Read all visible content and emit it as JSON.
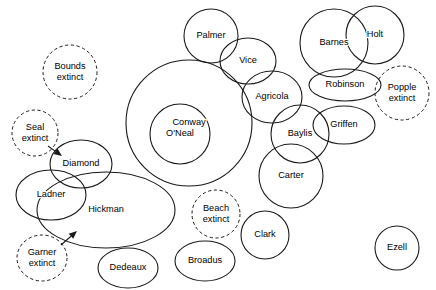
{
  "diagram": {
    "type": "euler-overlap-circle-diagram",
    "background_color": "#ffffff",
    "stroke_color": "#1a1a1a",
    "text_color": "#000000",
    "width": 436,
    "height": 290,
    "nodes": [
      {
        "id": "bounds",
        "label": "Bounds",
        "label2": "extinct",
        "style": "dashed",
        "shape": "circle",
        "cx": 70,
        "cy": 72,
        "rx": 27,
        "ry": 27
      },
      {
        "id": "seal",
        "label": "Seal",
        "label2": "extinct",
        "style": "dashed",
        "shape": "circle",
        "cx": 35,
        "cy": 133,
        "rx": 23,
        "ry": 23
      },
      {
        "id": "garner",
        "label": "Garner",
        "label2": "extinct",
        "style": "dashed",
        "shape": "ellipse",
        "cx": 42,
        "cy": 258,
        "rx": 25,
        "ry": 23
      },
      {
        "id": "popple",
        "label": "Popple",
        "label2": "extinct",
        "style": "dashed",
        "shape": "circle",
        "cx": 402,
        "cy": 93,
        "rx": 27,
        "ry": 27
      },
      {
        "id": "beach",
        "label": "Beach",
        "label2": "extinct",
        "style": "dashed",
        "shape": "circle",
        "cx": 216,
        "cy": 214,
        "rx": 24,
        "ry": 24
      },
      {
        "id": "palmer",
        "label": "Palmer",
        "label2": "",
        "style": "solid",
        "shape": "circle",
        "cx": 211,
        "cy": 36,
        "rx": 27,
        "ry": 27
      },
      {
        "id": "conway",
        "label": "Conway",
        "label2": "",
        "style": "solid",
        "shape": "circle",
        "cx": 189,
        "cy": 123,
        "rx": 63,
        "ry": 63
      },
      {
        "id": "oneal",
        "label": "O'Neal",
        "label2": "",
        "style": "solid",
        "shape": "circle",
        "cx": 180,
        "cy": 134,
        "rx": 30,
        "ry": 30
      },
      {
        "id": "vice",
        "label": "Vice",
        "label2": "",
        "style": "solid",
        "shape": "ellipse",
        "cx": 248,
        "cy": 61,
        "rx": 28,
        "ry": 23
      },
      {
        "id": "agricola",
        "label": "Agricola",
        "label2": "",
        "style": "solid",
        "shape": "ellipse",
        "cx": 272,
        "cy": 97,
        "rx": 30,
        "ry": 26
      },
      {
        "id": "barnes",
        "label": "Barnes",
        "label2": "",
        "style": "solid",
        "shape": "circle",
        "cx": 334,
        "cy": 43,
        "rx": 34,
        "ry": 34
      },
      {
        "id": "holt",
        "label": "Holt",
        "label2": "",
        "style": "solid",
        "shape": "circle",
        "cx": 375,
        "cy": 35,
        "rx": 29,
        "ry": 29
      },
      {
        "id": "robinson",
        "label": "Robinson",
        "label2": "",
        "style": "solid",
        "shape": "ellipse",
        "cx": 345,
        "cy": 85,
        "rx": 36,
        "ry": 16
      },
      {
        "id": "baylis",
        "label": "Baylis",
        "label2": "",
        "style": "solid",
        "shape": "circle",
        "cx": 300,
        "cy": 134,
        "rx": 29,
        "ry": 29
      },
      {
        "id": "griffen",
        "label": "Griffen",
        "label2": "",
        "style": "solid",
        "shape": "ellipse",
        "cx": 344,
        "cy": 125,
        "rx": 31,
        "ry": 19
      },
      {
        "id": "carter",
        "label": "Carter",
        "label2": "",
        "style": "solid",
        "shape": "circle",
        "cx": 291,
        "cy": 176,
        "rx": 32,
        "ry": 32
      },
      {
        "id": "diamond",
        "label": "Diamond",
        "label2": "",
        "style": "solid",
        "shape": "ellipse",
        "cx": 81,
        "cy": 164,
        "rx": 31,
        "ry": 24
      },
      {
        "id": "ladner",
        "label": "Ladner",
        "label2": "",
        "style": "solid",
        "shape": "ellipse",
        "cx": 51,
        "cy": 195,
        "rx": 35,
        "ry": 25
      },
      {
        "id": "hickman",
        "label": "Hickman",
        "label2": "",
        "style": "solid",
        "shape": "ellipse",
        "cx": 106,
        "cy": 210,
        "rx": 69,
        "ry": 38
      },
      {
        "id": "dedeaux",
        "label": "Dedeaux",
        "label2": "",
        "style": "solid",
        "shape": "ellipse",
        "cx": 128,
        "cy": 268,
        "rx": 30,
        "ry": 20
      },
      {
        "id": "broadus",
        "label": "Broadus",
        "label2": "",
        "style": "solid",
        "shape": "ellipse",
        "cx": 205,
        "cy": 261,
        "rx": 30,
        "ry": 20
      },
      {
        "id": "clark",
        "label": "Clark",
        "label2": "",
        "style": "solid",
        "shape": "circle",
        "cx": 265,
        "cy": 235,
        "rx": 24,
        "ry": 24
      },
      {
        "id": "ezell",
        "label": "Ezell",
        "label2": "",
        "style": "solid",
        "shape": "circle",
        "cx": 397,
        "cy": 248,
        "rx": 22,
        "ry": 22
      }
    ],
    "arrows": [
      {
        "id": "seal-to-diamond",
        "from": "seal",
        "to": "diamond",
        "x1": 48,
        "y1": 146,
        "x2": 62,
        "y2": 156
      },
      {
        "id": "garner-to-hickman",
        "from": "garner",
        "to": "hickman",
        "x1": 61,
        "y1": 245,
        "x2": 77,
        "y2": 231
      }
    ]
  }
}
